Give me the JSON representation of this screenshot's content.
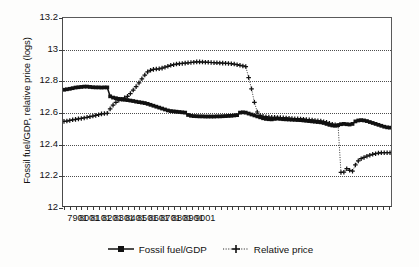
{
  "chart_data": {
    "type": "line",
    "title": "",
    "subtitle": "",
    "xlabel": "",
    "ylabel": "Fossil fuel/GDP, relative price (logs)",
    "ylim": [
      12,
      13.2
    ],
    "yticks": [
      "12",
      "12.2",
      "12.4",
      "12.6",
      "12.8",
      "13",
      "13.2"
    ],
    "ytick_values": [
      12,
      12.2,
      12.4,
      12.6,
      12.8,
      13,
      13.2
    ],
    "xtick_labels": [
      "7901",
      "8001",
      "8101",
      "8201",
      "8301",
      "8401",
      "8501",
      "8601",
      "8701",
      "8801",
      "8901",
      "9001"
    ],
    "xtick_values": [
      5,
      9,
      13,
      17,
      21,
      25,
      29,
      33,
      37,
      41,
      45,
      49
    ],
    "x_note": "quarterly index, YYQ format, 1978Q1 through 1990Q2",
    "grid": "horizontal dotted gridlines at 12.2, 12.4, 12.6, 12.8, 13.0",
    "legend_position": "bottom-center",
    "series": [
      {
        "name": "Fossil fuel/GDP",
        "marker": "filled-square",
        "linestyle": "solid",
        "color": "#111111",
        "values": [
          12.742,
          12.745,
          12.748,
          12.752,
          12.756,
          12.758,
          12.76,
          12.762,
          12.762,
          12.76,
          12.758,
          12.757,
          12.757,
          12.756,
          12.757,
          12.757,
          12.7,
          12.692,
          12.688,
          12.684,
          12.681,
          12.678,
          12.676,
          12.673,
          12.67,
          12.666,
          12.663,
          12.66,
          12.657,
          12.652,
          12.646,
          12.64,
          12.634,
          12.628,
          12.622,
          12.616,
          12.61,
          12.606,
          12.604,
          12.602,
          12.6,
          12.598,
          12.596,
          12.581,
          12.576,
          12.574,
          12.573,
          12.572,
          12.572,
          12.571,
          12.571,
          12.571,
          12.571,
          12.572,
          12.572,
          12.573,
          12.574,
          12.575,
          12.576,
          12.578,
          12.58,
          12.596,
          12.598,
          12.596,
          12.59,
          12.584,
          12.578,
          12.572,
          12.566,
          12.56,
          12.556,
          12.554,
          12.553,
          12.556,
          12.558,
          12.556,
          12.554,
          12.553,
          12.552,
          12.551,
          12.55,
          12.549,
          12.548,
          12.546,
          12.544,
          12.542,
          12.54,
          12.538,
          12.536,
          12.534,
          12.53,
          12.524,
          12.518,
          12.514,
          12.512,
          12.516,
          12.522,
          12.524,
          12.522,
          12.52,
          12.524,
          12.54,
          12.546,
          12.548,
          12.546,
          12.542,
          12.536,
          12.53,
          12.524,
          12.518,
          12.512,
          12.506,
          12.502,
          12.5
        ]
      },
      {
        "name": "Relative price",
        "marker": "plus",
        "linestyle": "dotted",
        "color": "#111111",
        "values": [
          12.54,
          12.542,
          12.546,
          12.55,
          12.553,
          12.556,
          12.559,
          12.562,
          12.566,
          12.57,
          12.574,
          12.578,
          12.583,
          12.588,
          12.59,
          12.592,
          12.62,
          12.644,
          12.662,
          12.675,
          12.682,
          12.69,
          12.7,
          12.718,
          12.74,
          12.762,
          12.786,
          12.812,
          12.836,
          12.856,
          12.866,
          12.872,
          12.874,
          12.876,
          12.88,
          12.886,
          12.892,
          12.898,
          12.902,
          12.906,
          12.908,
          12.91,
          12.912,
          12.914,
          12.916,
          12.918,
          12.92,
          12.92,
          12.919,
          12.918,
          12.917,
          12.916,
          12.915,
          12.914,
          12.913,
          12.912,
          12.911,
          12.91,
          12.908,
          12.906,
          12.902,
          12.898,
          12.894,
          12.89,
          12.82,
          12.748,
          12.662,
          12.6,
          12.578,
          12.572,
          12.57,
          12.568,
          12.566,
          12.566,
          12.565,
          12.564,
          12.563,
          12.562,
          12.56,
          12.558,
          12.557,
          12.556,
          12.555,
          12.554,
          12.552,
          12.55,
          12.548,
          12.546,
          12.544,
          12.542,
          12.538,
          12.534,
          12.528,
          12.522,
          12.518,
          12.516,
          12.214,
          12.216,
          12.238,
          12.228,
          12.222,
          12.262,
          12.288,
          12.302,
          12.31,
          12.318,
          12.324,
          12.33,
          12.334,
          12.338,
          12.34,
          12.34,
          12.34,
          12.34
        ]
      }
    ]
  },
  "legend": {
    "items": [
      {
        "label": "Fossil fuel/GDP",
        "marker": "filled-square",
        "linestyle": "solid"
      },
      {
        "label": "Relative price",
        "marker": "plus",
        "linestyle": "dotted"
      }
    ]
  }
}
